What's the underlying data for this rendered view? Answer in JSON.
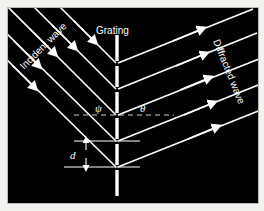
{
  "figure": {
    "background_color": "#000000",
    "line_color": "#ffffff",
    "page_color": "#f2f2f0",
    "border_color": "#b9b9b6"
  },
  "labels": {
    "incident_wave": "Incident wave",
    "grating": "Grating",
    "diffracted_wave": "Diffracted wave",
    "angle_psi": "ψ",
    "angle_theta": "θ",
    "spacing_d": "d"
  },
  "geometry": {
    "incident_angle_deg": 45,
    "diffracted_angle_deg": 22,
    "grating_x": 115,
    "vertices_y": [
      62,
      88,
      114,
      140,
      166
    ],
    "normal_line_y": 114,
    "spacing_top_y": 140,
    "spacing_bottom_y": 166
  },
  "elements": {
    "incident_ray_count": 5,
    "diffracted_ray_count": 5,
    "grating_segment_count": 6,
    "arrowheads_per_ray": 1
  }
}
